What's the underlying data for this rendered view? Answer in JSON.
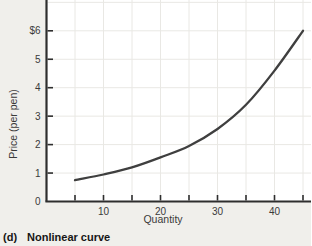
{
  "figure": {
    "caption_prefix": "(d)",
    "caption_text": "Nonlinear curve"
  },
  "chart_data": {
    "type": "line",
    "title": "",
    "xlabel": "Quantity",
    "ylabel": "Price (per pen)",
    "x": [
      5,
      10,
      15,
      20,
      25,
      30,
      35,
      40,
      45
    ],
    "y": [
      0.75,
      0.95,
      1.2,
      1.55,
      1.95,
      2.55,
      3.4,
      4.6,
      6.0
    ],
    "xlim": [
      0,
      46.5
    ],
    "ylim": [
      0,
      7.1
    ],
    "xticks": [
      5,
      10,
      15,
      20,
      25,
      30,
      35,
      40,
      45
    ],
    "xtick_label_at": [
      10,
      20,
      30,
      40
    ],
    "xtick_labels": [
      "10",
      "20",
      "30",
      "40"
    ],
    "yticks": [
      0,
      1,
      2,
      3,
      4,
      5,
      6
    ],
    "ytick_labels": [
      "0",
      "1",
      "2",
      "3",
      "4",
      "5",
      "$6"
    ],
    "grid": true,
    "legend": "none",
    "series_color": "#3f3f3f",
    "grid_color": "#e9e8e4",
    "axis_color": "#2e2e2e",
    "tick_text_color": "#3a3a3a",
    "plot_bg": "#ffffff",
    "outer_bg": "#f0efeb"
  }
}
